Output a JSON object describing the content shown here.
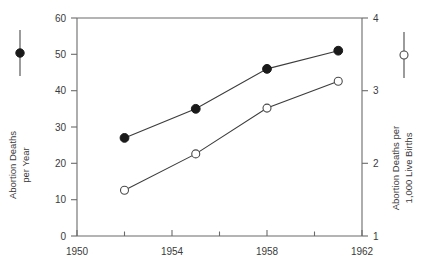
{
  "chart_data": {
    "type": "line",
    "title": "",
    "subtitle": "",
    "xlabel": "",
    "xlim": [
      1950,
      1962
    ],
    "x_ticks": [
      1950,
      1954,
      1958,
      1962
    ],
    "x_minor_ticks": [
      1952,
      1956,
      1960
    ],
    "grid": false,
    "legend_position": "outside-left-and-right",
    "axes": [
      {
        "id": "left",
        "label": "Abortion Deaths per Year",
        "label_lines": [
          "Abortion Deaths",
          "per Year"
        ],
        "ylim": [
          0,
          60
        ],
        "ticks": [
          0,
          10,
          20,
          30,
          40,
          50,
          60
        ],
        "tick_labels": [
          "0",
          "10",
          "20",
          "30",
          "40",
          "50",
          "60"
        ],
        "marker": "filled-circle"
      },
      {
        "id": "right",
        "label": "Abortion Deaths per 1,000 Live Births",
        "label_lines": [
          "Abortion Deaths per",
          "1,000 Live Births"
        ],
        "ylim": [
          1,
          4
        ],
        "ticks": [
          1,
          2,
          3,
          4
        ],
        "tick_labels": [
          "1",
          "2",
          "3",
          "4"
        ],
        "marker": "open-circle"
      }
    ],
    "series": [
      {
        "name": "Abortion Deaths per Year",
        "axis": "left",
        "marker": "filled-circle",
        "x": [
          1952,
          1955,
          1958,
          1961
        ],
        "values": [
          27,
          35,
          46,
          51
        ]
      },
      {
        "name": "Abortion Deaths per 1,000 Live Births",
        "axis": "right",
        "marker": "open-circle",
        "x": [
          1952,
          1955,
          1958,
          1961
        ],
        "values": [
          1.63,
          2.13,
          2.76,
          3.13
        ]
      }
    ]
  },
  "legend": {
    "left": {
      "marker": "filled-circle",
      "label_line1": "Abortion Deaths",
      "label_line2": "per Year"
    },
    "right": {
      "marker": "open-circle",
      "label_line1": "Abortion Deaths per",
      "label_line2": "1,000 Live Births"
    }
  },
  "x_tick_labels": {
    "t0": "1950",
    "t1": "1954",
    "t2": "1958",
    "t3": "1962"
  },
  "left_tick_labels": {
    "v0": "0",
    "v10": "10",
    "v20": "20",
    "v30": "30",
    "v40": "40",
    "v50": "50",
    "v60": "60"
  },
  "right_tick_labels": {
    "v1": "1",
    "v2": "2",
    "v3": "3",
    "v4": "4"
  },
  "colors": {
    "axis": "#6b6b6b",
    "line": "#3c3c3c",
    "marker_filled": "#1a1a1a",
    "marker_open_stroke": "#4a4a4a",
    "background": "#ffffff",
    "text": "#3a3a3a"
  }
}
